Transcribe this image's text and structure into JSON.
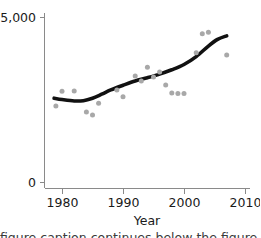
{
  "chart_data": {
    "type": "scatter",
    "title": "",
    "subtitle": "",
    "xlabel": "Year",
    "ylabel": "",
    "xlim": [
      1977.5,
      2010.8
    ],
    "ylim": [
      0,
      5500
    ],
    "grid": false,
    "legend": null,
    "xticks": [
      1980,
      1990,
      2000,
      2010
    ],
    "xtick_labels": [
      "1980",
      "1990",
      "2000",
      "2010"
    ],
    "yticks": [
      0,
      5000
    ],
    "ytick_labels": [
      "0",
      "$5,000"
    ],
    "point_color": "#a8a8a8",
    "line_color": "#111111",
    "axis_color": "#8a8a8a",
    "points": [
      {
        "x": 1979,
        "y": 2300
      },
      {
        "x": 1980,
        "y": 2750
      },
      {
        "x": 1982,
        "y": 2760
      },
      {
        "x": 1984,
        "y": 2120
      },
      {
        "x": 1985,
        "y": 2030
      },
      {
        "x": 1986,
        "y": 2390
      },
      {
        "x": 1989,
        "y": 2790
      },
      {
        "x": 1990,
        "y": 2580
      },
      {
        "x": 1992,
        "y": 3210
      },
      {
        "x": 1993,
        "y": 3060
      },
      {
        "x": 1994,
        "y": 3480
      },
      {
        "x": 1995,
        "y": 3180
      },
      {
        "x": 1996,
        "y": 3330
      },
      {
        "x": 1997,
        "y": 2940
      },
      {
        "x": 1998,
        "y": 2700
      },
      {
        "x": 1999,
        "y": 2680
      },
      {
        "x": 2000,
        "y": 2680
      },
      {
        "x": 2002,
        "y": 3920
      },
      {
        "x": 2003,
        "y": 4490
      },
      {
        "x": 2004,
        "y": 4540
      },
      {
        "x": 2007,
        "y": 3850
      }
    ],
    "trend": [
      {
        "x": 1978.7,
        "y": 2540
      },
      {
        "x": 1980.0,
        "y": 2500
      },
      {
        "x": 1982.0,
        "y": 2455
      },
      {
        "x": 1983.5,
        "y": 2465
      },
      {
        "x": 1985.0,
        "y": 2540
      },
      {
        "x": 1986.5,
        "y": 2660
      },
      {
        "x": 1988.0,
        "y": 2790
      },
      {
        "x": 1990.0,
        "y": 2930
      },
      {
        "x": 1992.0,
        "y": 3060
      },
      {
        "x": 1994.0,
        "y": 3160
      },
      {
        "x": 1996.0,
        "y": 3270
      },
      {
        "x": 1998.0,
        "y": 3400
      },
      {
        "x": 2000.0,
        "y": 3560
      },
      {
        "x": 2002.0,
        "y": 3800
      },
      {
        "x": 2004.0,
        "y": 4120
      },
      {
        "x": 2005.5,
        "y": 4320
      },
      {
        "x": 2007.0,
        "y": 4430
      }
    ]
  },
  "axes": {
    "y_top_label": "$5,000",
    "y_bottom_label": "0",
    "x_labels": [
      "1980",
      "1990",
      "2000",
      "2010"
    ],
    "x_title": "Year"
  },
  "caption": {
    "cut_off_line": "figure caption continues below the figure"
  }
}
